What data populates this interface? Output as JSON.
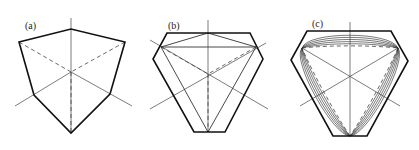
{
  "figure": {
    "panels": [
      {
        "id": "a",
        "label": "(a)",
        "label_pos": [
          25,
          29
        ],
        "center": [
          71,
          72
        ],
        "axes": {
          "vertical": [
            [
              71,
              18
            ],
            [
              71,
              133
            ]
          ],
          "diag_left": [
            [
              15,
              106
            ],
            [
              71,
              72
            ]
          ],
          "diag_right": [
            [
              71,
              72
            ],
            [
              132,
              106
            ]
          ]
        },
        "outline": [
          [
            19,
            42
          ],
          [
            71,
            29
          ],
          [
            125,
            42
          ],
          [
            110,
            94
          ],
          [
            71,
            133
          ],
          [
            34,
            95
          ]
        ],
        "dashed": [
          [
            [
              19,
              42
            ],
            [
              71,
              72
            ]
          ],
          [
            [
              125,
              42
            ],
            [
              71,
              72
            ]
          ],
          [
            [
              71,
              72
            ],
            [
              71,
              133
            ]
          ]
        ]
      },
      {
        "id": "b",
        "label": "(b)",
        "label_pos": [
          168,
          29
        ],
        "center": [
          208,
          74
        ],
        "axes": {
          "vertical": [
            [
              208,
              20
            ],
            [
              208,
              132
            ]
          ],
          "diag_left": [
            [
              150,
              109
            ],
            [
              266,
              43
            ]
          ],
          "diag_right": [
            [
              150,
              40
            ],
            [
              268,
              109
            ]
          ]
        },
        "hexagon": [
          [
            167,
            33
          ],
          [
            250,
            33
          ],
          [
            263,
            59
          ],
          [
            225,
            132
          ],
          [
            194,
            132
          ],
          [
            153,
            59
          ]
        ],
        "triangle": [
          [
            161,
            47
          ],
          [
            256,
            47
          ],
          [
            208,
            132
          ]
        ],
        "chords": [
          [
            [
              161,
              47
            ],
            [
              208,
              33
            ]
          ],
          [
            [
              208,
              33
            ],
            [
              256,
              47
            ]
          ]
        ],
        "dashed": [
          [
            [
              161,
              47
            ],
            [
              208,
              74
            ]
          ],
          [
            [
              256,
              47
            ],
            [
              208,
              74
            ]
          ],
          [
            [
              208,
              74
            ],
            [
              208,
              132
            ]
          ]
        ]
      },
      {
        "id": "c",
        "label": "(c)",
        "label_pos": [
          312,
          27
        ],
        "center": [
          350,
          77
        ],
        "axes": {
          "vertical": [
            [
              350,
              22
            ],
            [
              350,
              136
            ]
          ],
          "diag_left": [
            [
              300,
              106
            ],
            [
              398,
              48
            ]
          ],
          "diag_right": [
            [
              302,
              48
            ],
            [
              400,
              106
            ]
          ]
        },
        "hexagon": [
          [
            307,
            31
          ],
          [
            391,
            31
          ],
          [
            408,
            61
          ],
          [
            367,
            136
          ],
          [
            333,
            136
          ],
          [
            291,
            60
          ]
        ],
        "triangle": [
          [
            302,
            48
          ],
          [
            398,
            48
          ],
          [
            350,
            136
          ]
        ],
        "nested_levels": 5
      }
    ]
  }
}
